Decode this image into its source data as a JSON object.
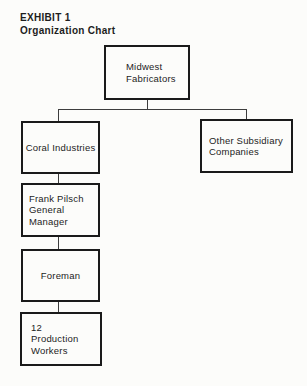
{
  "heading": {
    "exhibit": "EXHIBIT 1",
    "title": "Organization Chart"
  },
  "org": {
    "midwest": {
      "lines": [
        "Midwest",
        "Fabricators"
      ]
    },
    "coral": {
      "lines": [
        "Coral Industries"
      ]
    },
    "other_subsidiary": {
      "lines": [
        "Other Subsidiary",
        "Companies"
      ]
    },
    "general_manager": {
      "lines": [
        "Frank Pilsch",
        "General",
        "Manager"
      ]
    },
    "foreman": {
      "lines": [
        "Foreman"
      ]
    },
    "production_workers": {
      "lines": [
        "12",
        "Production",
        "Workers"
      ]
    }
  },
  "colors": {
    "paper": "#fcfcfa",
    "ink": "#1d1d1d",
    "border": "#1a1a1a",
    "rule": "#3d3d3d"
  }
}
